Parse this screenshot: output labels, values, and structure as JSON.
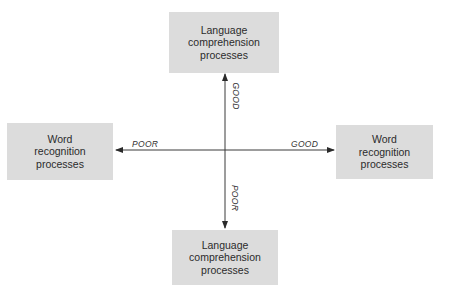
{
  "diagram": {
    "type": "quadrant-axes",
    "center": {
      "x": 225,
      "y": 150
    },
    "colors": {
      "box_fill": "#dcdcdc",
      "axis_line": "#3a3a3a",
      "text": "#2b2b2b"
    },
    "boxes": {
      "top": {
        "label": "Language\ncomprehension\nprocesses"
      },
      "left": {
        "label": "Word\nrecognition\nprocesses"
      },
      "right": {
        "label": "Word\nrecognition\nprocesses"
      },
      "bottom": {
        "label": "Language\ncomprehension\nprocesses"
      }
    },
    "axis_labels": {
      "left": "POOR",
      "right": "GOOD",
      "top": "GOOD",
      "bottom": "POOR"
    }
  }
}
